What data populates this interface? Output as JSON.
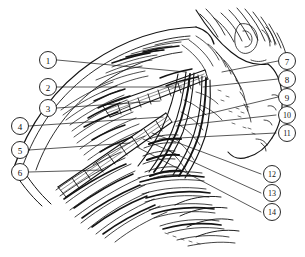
{
  "figure": {
    "style": "pen-and-ink line engraving, black on white",
    "background_color": "#ffffff",
    "ink_color": "#111111",
    "width": 305,
    "height": 257
  },
  "callouts": [
    {
      "id": "callout-1",
      "label": "1",
      "cx": 48,
      "cy": 60,
      "side": "left",
      "lx1": 57,
      "ly1": 60,
      "lx2": 186,
      "ly2": 72
    },
    {
      "id": "callout-2",
      "label": "2",
      "cx": 48,
      "cy": 87,
      "side": "left",
      "lx1": 57,
      "ly1": 87,
      "lx2": 182,
      "ly2": 87
    },
    {
      "id": "callout-3",
      "label": "3",
      "cx": 48,
      "cy": 108,
      "side": "left",
      "lx1": 57,
      "ly1": 108,
      "lx2": 160,
      "ly2": 101
    },
    {
      "id": "callout-4",
      "label": "4",
      "cx": 20,
      "cy": 126,
      "side": "left",
      "lx1": 29,
      "ly1": 126,
      "lx2": 163,
      "ly2": 117
    },
    {
      "id": "callout-5",
      "label": "5",
      "cx": 20,
      "cy": 150,
      "side": "left",
      "lx1": 29,
      "ly1": 150,
      "lx2": 130,
      "ly2": 143
    },
    {
      "id": "callout-6",
      "label": "6",
      "cx": 20,
      "cy": 172,
      "side": "left",
      "lx1": 29,
      "ly1": 172,
      "lx2": 103,
      "ly2": 170
    },
    {
      "id": "callout-7",
      "label": "7",
      "cx": 287,
      "cy": 61,
      "side": "right",
      "lx1": 278,
      "ly1": 61,
      "lx2": 222,
      "ly2": 72
    },
    {
      "id": "callout-8",
      "label": "8",
      "cx": 287,
      "cy": 79,
      "side": "right",
      "lx1": 278,
      "ly1": 79,
      "lx2": 203,
      "ly2": 87
    },
    {
      "id": "callout-9",
      "label": "9",
      "cx": 287,
      "cy": 97,
      "side": "right",
      "lx1": 278,
      "ly1": 97,
      "lx2": 174,
      "ly2": 122
    },
    {
      "id": "callout-10",
      "label": "10",
      "cx": 287,
      "cy": 115,
      "side": "right",
      "lx1": 276,
      "ly1": 115,
      "lx2": 176,
      "ly2": 126
    },
    {
      "id": "callout-11",
      "label": "11",
      "cx": 287,
      "cy": 133,
      "side": "right",
      "lx1": 276,
      "ly1": 133,
      "lx2": 159,
      "ly2": 139
    },
    {
      "id": "callout-12",
      "label": "12",
      "cx": 272,
      "cy": 174,
      "side": "right",
      "lx1": 261,
      "ly1": 174,
      "lx2": 152,
      "ly2": 133
    },
    {
      "id": "callout-13",
      "label": "13",
      "cx": 272,
      "cy": 193,
      "side": "right",
      "lx1": 261,
      "ly1": 193,
      "lx2": 143,
      "ly2": 139
    },
    {
      "id": "callout-14",
      "label": "14",
      "cx": 272,
      "cy": 212,
      "side": "right",
      "lx1": 261,
      "ly1": 212,
      "lx2": 137,
      "ly2": 147
    }
  ]
}
